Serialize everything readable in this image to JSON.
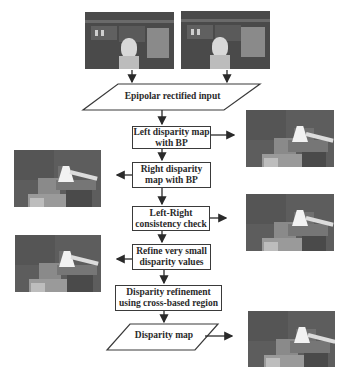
{
  "diagram": {
    "inputs": {
      "left_image": "left-stereo-photo",
      "right_image": "right-stereo-photo"
    },
    "nodes": [
      {
        "id": "input",
        "shape": "parallelogram",
        "label": "Epipolar rectified input"
      },
      {
        "id": "left_bp",
        "shape": "rectangle",
        "label_line1": "Left disparity map",
        "label_line2": "with BP"
      },
      {
        "id": "right_bp",
        "shape": "rectangle",
        "label_line1": "Right disparity",
        "label_line2": "map with BP"
      },
      {
        "id": "lr_check",
        "shape": "rectangle",
        "label_line1": "Left-Right",
        "label_line2": "consistency check"
      },
      {
        "id": "refine_small",
        "shape": "rectangle",
        "label_line1": "Refine very small",
        "label_line2": "disparity values"
      },
      {
        "id": "cross_refine",
        "shape": "rectangle",
        "label_line1": "Disparity refinement",
        "label_line2": "using cross-based region"
      },
      {
        "id": "output",
        "shape": "parallelogram",
        "label": "Disparity map"
      }
    ],
    "edges": [
      [
        "left_image",
        "input"
      ],
      [
        "right_image",
        "input"
      ],
      [
        "input",
        "left_bp"
      ],
      [
        "left_bp",
        "right_bp"
      ],
      [
        "right_bp",
        "lr_check"
      ],
      [
        "lr_check",
        "refine_small"
      ],
      [
        "refine_small",
        "cross_refine"
      ],
      [
        "cross_refine",
        "output"
      ]
    ],
    "result_images": [
      {
        "from": "left_bp",
        "side": "right",
        "name": "left-disparity-result"
      },
      {
        "from": "right_bp",
        "side": "left",
        "name": "right-disparity-result"
      },
      {
        "from": "lr_check",
        "side": "right",
        "name": "lr-check-result"
      },
      {
        "from": "refine_small",
        "side": "left",
        "name": "refine-small-result"
      },
      {
        "from": "output",
        "side": "right",
        "name": "final-disparity-result"
      }
    ]
  },
  "colors": {
    "line": "#2a2a2a",
    "box_border": "#3a3a3a",
    "text": "#2a2a2a",
    "background": "#ffffff"
  }
}
